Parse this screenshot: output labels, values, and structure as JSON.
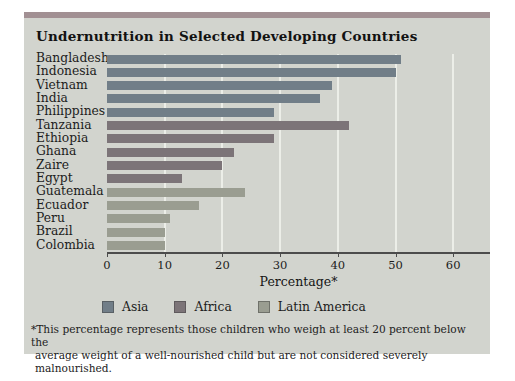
{
  "title": "Undernutrition in Selected Developing Countries",
  "chart_data": {
    "type": "bar",
    "orientation": "horizontal",
    "title": "Undernutrition in Selected Developing Countries",
    "xlabel": "Percentage*",
    "ylabel": "",
    "xlim": [
      0,
      66
    ],
    "x_ticks": [
      0,
      10,
      20,
      30,
      40,
      50,
      60
    ],
    "grid": "vertical light gridlines at each tick",
    "legend_position": "bottom",
    "groups": [
      {
        "name": "Asia",
        "color": "#717E88"
      },
      {
        "name": "Africa",
        "color": "#7C7478"
      },
      {
        "name": "Latin America",
        "color": "#9A9D91"
      }
    ],
    "bars": [
      {
        "country": "Bangladesh",
        "region": "Asia",
        "value": 51
      },
      {
        "country": "Indonesia",
        "region": "Asia",
        "value": 50
      },
      {
        "country": "Vietnam",
        "region": "Asia",
        "value": 39
      },
      {
        "country": "India",
        "region": "Asia",
        "value": 37
      },
      {
        "country": "Philippines",
        "region": "Asia",
        "value": 29
      },
      {
        "country": "Tanzania",
        "region": "Africa",
        "value": 42
      },
      {
        "country": "Ethiopia",
        "region": "Africa",
        "value": 29
      },
      {
        "country": "Ghana",
        "region": "Africa",
        "value": 22
      },
      {
        "country": "Zaire",
        "region": "Africa",
        "value": 20
      },
      {
        "country": "Egypt",
        "region": "Africa",
        "value": 13
      },
      {
        "country": "Guatemala",
        "region": "Latin America",
        "value": 24
      },
      {
        "country": "Ecuador",
        "region": "Latin America",
        "value": 16
      },
      {
        "country": "Peru",
        "region": "Latin America",
        "value": 11
      },
      {
        "country": "Brazil",
        "region": "Latin America",
        "value": 10
      },
      {
        "country": "Colombia",
        "region": "Latin America",
        "value": 10
      }
    ]
  },
  "footnote": {
    "line1": "*This percentage represents those children who weigh at least 20 percent below the",
    "line2": "average weight of a well-nourished child but are not considered severely malnourished."
  },
  "colors": {
    "card_background": "#d2d4ce",
    "top_strip": "#a29093",
    "axis_line": "#4c4c4c",
    "gridline": "#eceee8",
    "asia_bar": "#717E88",
    "africa_bar": "#7C7478",
    "latin_america_bar": "#9A9D91"
  }
}
